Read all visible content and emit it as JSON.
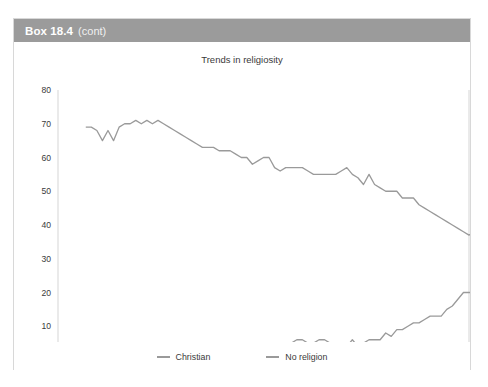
{
  "box": {
    "label": "Box 18.4",
    "continuation": "(cont)",
    "header_color": "#9b9b9b",
    "border_color": "#d8d8d8"
  },
  "chart_data": {
    "type": "line",
    "title": "Trends in religiosity",
    "xlabel": "",
    "ylabel": "",
    "xlim": [
      1945,
      2019
    ],
    "ylim": [
      0,
      80
    ],
    "xticks": [
      1945,
      1955,
      1965,
      1975,
      1985,
      1995,
      2005,
      2015
    ],
    "yticks": [
      0,
      10,
      20,
      30,
      40,
      50,
      60,
      70,
      80
    ],
    "grid": false,
    "legend_position": "bottom",
    "line_color": "#9a9a9a",
    "series": [
      {
        "name": "Christian",
        "x": [
          1950,
          1951,
          1952,
          1953,
          1954,
          1955,
          1956,
          1957,
          1958,
          1959,
          1960,
          1961,
          1962,
          1963,
          1964,
          1965,
          1966,
          1967,
          1968,
          1969,
          1970,
          1971,
          1972,
          1973,
          1974,
          1975,
          1976,
          1977,
          1978,
          1979,
          1980,
          1981,
          1982,
          1983,
          1984,
          1985,
          1986,
          1987,
          1988,
          1989,
          1990,
          1991,
          1992,
          1993,
          1994,
          1995,
          1996,
          1997,
          1998,
          1999,
          2000,
          2001,
          2002,
          2003,
          2004,
          2005,
          2006,
          2007,
          2008,
          2009,
          2010,
          2011,
          2012,
          2013,
          2014,
          2015,
          2016,
          2017,
          2018
        ],
        "values": [
          69,
          69,
          68,
          65,
          68,
          65,
          69,
          70,
          70,
          71,
          70,
          71,
          70,
          71,
          70,
          69,
          68,
          67,
          66,
          65,
          64,
          63,
          63,
          63,
          62,
          62,
          62,
          61,
          60,
          60,
          58,
          59,
          60,
          60,
          57,
          56,
          57,
          57,
          57,
          57,
          56,
          55,
          55,
          55,
          55,
          55,
          56,
          57,
          55,
          54,
          52,
          55,
          52,
          51,
          50,
          50,
          50,
          48,
          48,
          48,
          46,
          45,
          44,
          43,
          42,
          41,
          40,
          39,
          38
        ],
        "values_tail": [
          38,
          37,
          38,
          38,
          38,
          36,
          35,
          35
        ]
      },
      {
        "name": "No religion",
        "x": [
          1950,
          1951,
          1952,
          1953,
          1954,
          1955,
          1956,
          1957,
          1958,
          1959,
          1960,
          1961,
          1962,
          1963,
          1964,
          1965,
          1966,
          1967,
          1968,
          1969,
          1970,
          1971,
          1972,
          1973,
          1974,
          1975,
          1976,
          1977,
          1978,
          1979,
          1980,
          1981,
          1982,
          1983,
          1984,
          1985,
          1986,
          1987,
          1988,
          1989,
          1990,
          1991,
          1992,
          1993,
          1994,
          1995,
          1996,
          1997,
          1998,
          1999,
          2000,
          2001,
          2002,
          2003,
          2004,
          2005,
          2006,
          2007,
          2008,
          2009,
          2010,
          2011,
          2012,
          2013,
          2014,
          2015,
          2016,
          2017,
          2018
        ],
        "values": [
          2,
          1,
          1,
          1,
          1,
          1,
          1,
          1,
          1,
          1,
          1,
          1,
          1,
          1,
          1,
          1,
          1,
          2,
          2,
          1,
          1,
          3,
          3,
          2,
          3,
          3,
          3,
          3,
          3,
          3,
          4,
          4,
          4,
          4,
          4,
          5,
          5,
          5,
          6,
          6,
          5,
          5,
          6,
          6,
          5,
          4,
          4,
          4,
          6,
          4,
          5,
          6,
          6,
          6,
          8,
          7,
          9,
          9,
          10,
          11,
          11,
          12,
          13,
          13,
          13,
          15,
          16,
          18,
          20
        ],
        "values_tail": [
          20,
          20,
          20,
          20
        ]
      }
    ],
    "legend": [
      "Christian",
      "No religion"
    ]
  }
}
